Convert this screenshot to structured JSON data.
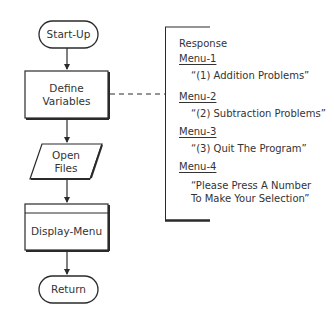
{
  "flowchart": {
    "nodes": [
      {
        "id": "start",
        "shape": "terminal",
        "label": "Start-Up"
      },
      {
        "id": "define",
        "shape": "process",
        "label_line1": "Define",
        "label_line2": "Variables"
      },
      {
        "id": "open",
        "shape": "input-output",
        "label_line1": "Open",
        "label_line2": "Files"
      },
      {
        "id": "display",
        "shape": "predefined-process",
        "label": "Display-Menu"
      },
      {
        "id": "return",
        "shape": "terminal",
        "label": "Return"
      }
    ],
    "edges": [
      {
        "from": "start",
        "to": "define"
      },
      {
        "from": "define",
        "to": "open"
      },
      {
        "from": "open",
        "to": "display"
      },
      {
        "from": "display",
        "to": "return"
      }
    ]
  },
  "annotation": {
    "title": "Response",
    "items": [
      {
        "name": "Menu-1",
        "value": "“(1) Addition Problems”"
      },
      {
        "name": "Menu-2",
        "value": "“(2) Subtraction Problems”"
      },
      {
        "name": "Menu-3",
        "value": "“(3) Quit The Program”"
      },
      {
        "name": "Menu-4",
        "value_line1": "“Please Press A Number",
        "value_line2": "To Make Your Selection”"
      }
    ],
    "connected_to": "define"
  },
  "colors": {
    "stroke": "#2a2a2a",
    "background": "#ffffff"
  }
}
